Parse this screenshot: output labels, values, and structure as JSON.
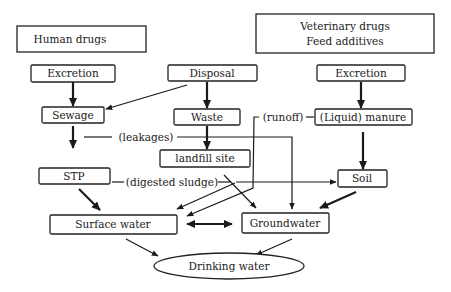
{
  "diagram": {
    "type": "flowchart",
    "nodes": {
      "human_drugs": "Human drugs",
      "vet_drugs": "Veterinary drugs",
      "feed_additives": "Feed additives",
      "excretion_human": "Excretion",
      "disposal": "Disposal",
      "excretion_vet": "Excretion",
      "sewage": "Sewage",
      "waste": "Waste",
      "manure": "(Liquid) manure",
      "landfill": "landfill site",
      "stp": "STP",
      "soil": "Soil",
      "surface_water": "Surface water",
      "groundwater": "Groundwater",
      "drinking_water": "Drinking water"
    },
    "edge_labels": {
      "leakages": "(leakages)",
      "runoff": "(runoff)",
      "digested_sludge": "(digested sludge)"
    },
    "edges": [
      {
        "from": "Excretion (human)",
        "to": "Sewage",
        "style": "bold"
      },
      {
        "from": "Disposal",
        "to": "Sewage",
        "style": "thin"
      },
      {
        "from": "Disposal",
        "to": "Waste",
        "style": "bold"
      },
      {
        "from": "Excretion (vet)",
        "to": "(Liquid) manure",
        "style": "bold"
      },
      {
        "from": "Sewage",
        "to": "STP",
        "style": "bold"
      },
      {
        "from": "Sewage",
        "to": "Groundwater",
        "label": "(leakages)",
        "style": "thin"
      },
      {
        "from": "Waste",
        "to": "landfill site",
        "style": "bold"
      },
      {
        "from": "(Liquid) manure",
        "to": "Surface water",
        "label": "(runoff)",
        "style": "thin"
      },
      {
        "from": "(Liquid) manure",
        "to": "Soil",
        "style": "thick"
      },
      {
        "from": "STP",
        "to": "Soil",
        "label": "(digested sludge)",
        "style": "thin"
      },
      {
        "from": "STP",
        "to": "Surface water",
        "style": "thick"
      },
      {
        "from": "landfill site",
        "to": "Surface water",
        "style": "thin"
      },
      {
        "from": "landfill site",
        "to": "Groundwater",
        "style": "thin"
      },
      {
        "from": "Soil",
        "to": "Groundwater",
        "style": "thick"
      },
      {
        "from": "Surface water",
        "to": "Groundwater",
        "style": "bidirectional-thick"
      },
      {
        "from": "Surface water",
        "to": "Drinking water",
        "style": "thin"
      },
      {
        "from": "Groundwater",
        "to": "Drinking water",
        "style": "thin"
      }
    ]
  }
}
